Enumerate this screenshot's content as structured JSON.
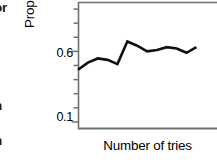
{
  "figure": {
    "kind": "line-chart-figure-crop",
    "background": "#ffffff",
    "ink_color": "#111111",
    "axis_color": "#6f6f6f"
  },
  "page_text_fragments": {
    "top": "or",
    "middle": "n",
    "bottom": "n"
  },
  "chart_data": {
    "type": "line",
    "title": "",
    "subtitle": "",
    "xlabel": "Number of tries",
    "ylabel": "Proportion of successes",
    "ytick_labels": [
      "0.6",
      "0.1"
    ],
    "ytick_values": [
      0.6,
      0.1
    ],
    "xtick_labels": [],
    "ylim": [
      0.05,
      0.95
    ],
    "xlim": [
      0,
      15
    ],
    "grid": false,
    "legend": null,
    "legend_position": "none",
    "minor_ticks": true,
    "minor_tick_step": 0.1,
    "clipped_right_edge": true,
    "annotations": [],
    "series": [
      {
        "name": "Proportion of successes",
        "color": "#111111",
        "linewidth": 2.6,
        "x": [
          0,
          1,
          2,
          3,
          4,
          5,
          6,
          7,
          8,
          9,
          10,
          11,
          12
        ],
        "values": [
          0.47,
          0.52,
          0.55,
          0.54,
          0.51,
          0.67,
          0.64,
          0.6,
          0.61,
          0.63,
          0.62,
          0.59,
          0.63
        ]
      }
    ]
  }
}
